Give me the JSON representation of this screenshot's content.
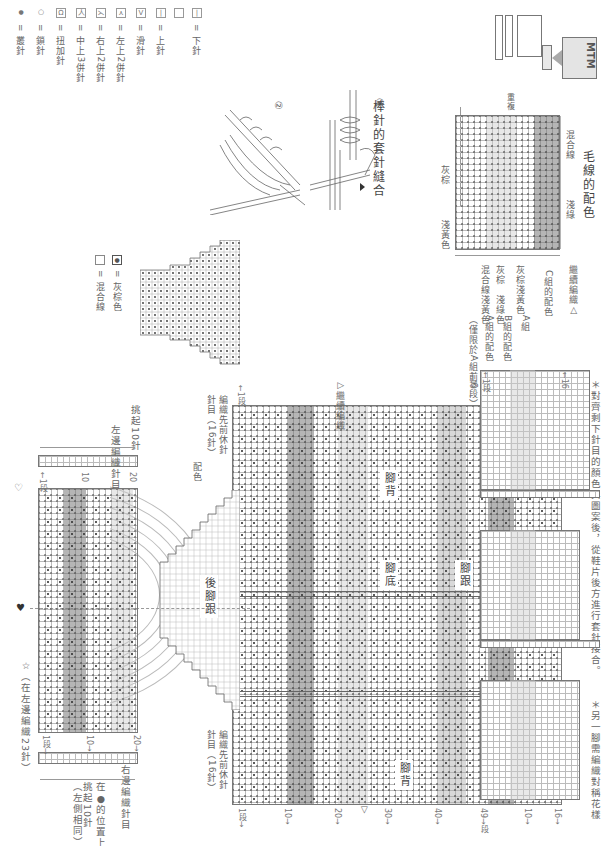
{
  "page": {
    "orientation": "rotated 90deg clockwise",
    "logo_text": "MTM"
  },
  "legend": {
    "items": [
      {
        "symbol": "|",
        "label": "= 下針",
        "icon": "knit-stitch-icon"
      },
      {
        "symbol": "",
        "label": "",
        "icon": "blank-stitch-icon"
      },
      {
        "symbol": "—",
        "label": "= 上針",
        "icon": "purl-stitch-icon"
      },
      {
        "symbol": "V",
        "label": "= 滑針",
        "icon": "slip-stitch-icon"
      },
      {
        "symbol": "入",
        "label": "= 左上2併針",
        "icon": "left-k2tog-icon"
      },
      {
        "symbol": "入",
        "label": "= 右上2併針",
        "icon": "right-k2tog-icon"
      },
      {
        "symbol": "人",
        "label": "= 中上3併針",
        "icon": "center-3tog-icon"
      },
      {
        "symbol": "Ω",
        "label": "= 扭加針",
        "icon": "twisted-increase-icon"
      },
      {
        "symbol": "○",
        "label": "= 鎖針",
        "icon": "chain-stitch-icon"
      },
      {
        "symbol": "●",
        "label": "= 叢針",
        "icon": "bobble-stitch-icon"
      }
    ]
  },
  "color_chart": {
    "title": "毛線的配色",
    "top_label": "重複",
    "labels": [
      "混合線",
      "淺綠",
      "灰棕",
      "淺黃色"
    ],
    "bottom_labels": [
      "混合線",
      "淺黃色",
      "灰棕",
      "淺綠色",
      "灰棕",
      "淺黃色"
    ],
    "groups": {
      "title": "繼續編織△",
      "c": "C組的配色",
      "a": "A組",
      "b": "B組的配色",
      "a2": "A組的配色",
      "note": "（僅限於A組前6段）"
    }
  },
  "joining": {
    "title": "棒針的套針縫合",
    "steps": [
      "①",
      "②"
    ]
  },
  "gusset_legend": {
    "dot_label": "= 灰棕色",
    "blank_label": "= 混合線"
  },
  "notes": {
    "note1_line1": "＊對齊剩下針目的顏色與圖案後，從鞋片後方進行套針接合。",
    "note1_line2": "前中心",
    "back_center": "後中心",
    "note2": "＊另一腳需編織對稱花樣"
  },
  "main_chart": {
    "labels": {
      "instep": "腳背",
      "sole": "腳底",
      "heel": "腳跟",
      "toe": "腳背"
    },
    "continue": "▷繼續編織",
    "continue2": "繼續編織△",
    "row_ticks_top": [
      "←1段",
      "←49"
    ],
    "col_ticks_top": [
      "←16"
    ],
    "col_ticks_bottom": [
      "1段→",
      "10→",
      "20→",
      "30→",
      "40→",
      "49→段"
    ],
    "bottom_right_ticks": [
      "16→",
      "10→",
      "1段→",
      "49→"
    ],
    "stop_label": "編織先前休針",
    "stop_label2": "針目（16針）"
  },
  "heel": {
    "title": "後腳跟",
    "left_pick": "挑起10針",
    "left_rows": "左邊編織針目",
    "left_stop": "編織先前休針",
    "left_stop2": "針目（16針）",
    "color_mark": "配色",
    "right_rows": "右邊編織針目",
    "right_pick1": "在●的位置上",
    "right_pick2": "挑起10針",
    "right_pick3": "（左側相同）",
    "note": "☆（在左邊編織23針）",
    "ticks": [
      "1段→",
      "10→",
      "20→"
    ],
    "top_ticks": [
      "←1段",
      "10",
      "20"
    ],
    "heart": "♥",
    "diamond": "♡"
  }
}
